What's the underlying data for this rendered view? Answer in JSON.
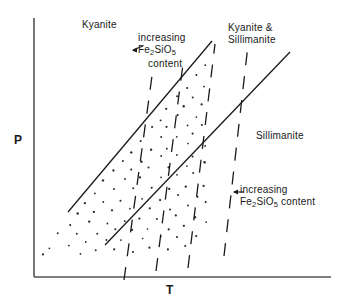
{
  "figure": {
    "type": "phase-diagram",
    "background_color": "#ffffff",
    "line_color": "#1a1a1a"
  },
  "axes": {
    "y_label": "P",
    "x_label": "T",
    "x_axis": {
      "x1": 34,
      "y1": 277,
      "x2": 330,
      "y2": 277
    },
    "y_axis": {
      "x1": 34,
      "y1": 18,
      "x2": 34,
      "y2": 277
    }
  },
  "fields": {
    "kyanite": "Kyanite",
    "kyanite_sillimanite_line1": "Kyanite &",
    "kyanite_sillimanite_line2": "Sillimanite",
    "sillimanite": "Sillimanite"
  },
  "annotations": {
    "upper": {
      "line1": "increasing",
      "line2_pre": "Fe",
      "line2_sub1": "2",
      "line2_mid": "SiO",
      "line2_sub2": "5",
      "line3": "content"
    },
    "lower": {
      "line1": "increasing",
      "line2_pre": "Fe",
      "line2_sub1": "2",
      "line2_mid": "SiO",
      "line2_sub2": "5",
      "line2_post": " content"
    }
  },
  "chart_data": {
    "type": "line",
    "title": "",
    "xlabel": "T",
    "ylabel": "P",
    "grid": false,
    "legend": "none",
    "solid_boundaries": [
      {
        "name": "kyanite-in boundary",
        "x1": 68,
        "y1": 212,
        "x2": 212,
        "y2": 41
      },
      {
        "name": "sillimanite-in boundary",
        "x1": 105,
        "y1": 245,
        "x2": 290,
        "y2": 52
      }
    ],
    "dashed_isopleths": [
      {
        "name": "isopleth-1",
        "x1": 124,
        "y1": 280,
        "x2": 152,
        "y2": 76
      },
      {
        "name": "isopleth-2",
        "x1": 156,
        "y1": 271,
        "x2": 183,
        "y2": 64
      },
      {
        "name": "isopleth-3",
        "x1": 188,
        "y1": 268,
        "x2": 215,
        "y2": 44
      },
      {
        "name": "isopleth-4",
        "x1": 224,
        "y1": 256,
        "x2": 248,
        "y2": 45
      }
    ],
    "stipple_region": {
      "name": "kyanite-field-stipple",
      "pattern": "diagonal dotted lines parallel to the solid boundaries",
      "rows": 9
    }
  }
}
